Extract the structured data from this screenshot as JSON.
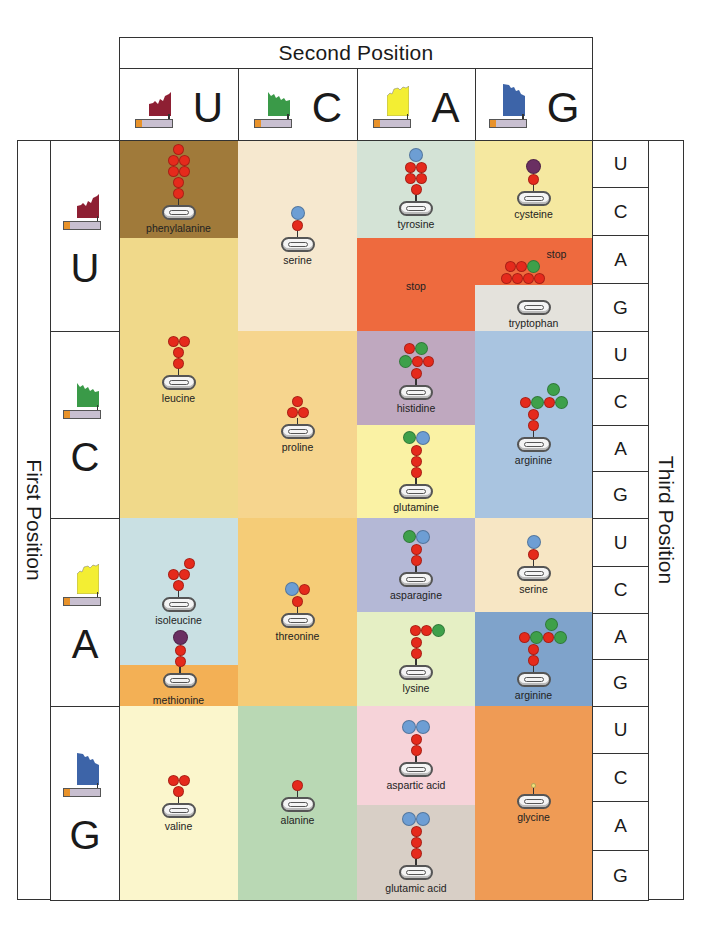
{
  "title_second": "Second Position",
  "title_first": "First Position",
  "title_third": "Third Position",
  "bases": [
    "U",
    "C",
    "A",
    "G"
  ],
  "base_colors": {
    "U": "#8e1f33",
    "C": "#3a9a48",
    "A": "#f3ee33",
    "G": "#3d64a8"
  },
  "second_position": [
    {
      "base": "U"
    },
    {
      "base": "C"
    },
    {
      "base": "A"
    },
    {
      "base": "G"
    }
  ],
  "first_position": [
    {
      "base": "U"
    },
    {
      "base": "C"
    },
    {
      "base": "A"
    },
    {
      "base": "G"
    }
  ],
  "third_position": [
    "U",
    "C",
    "A",
    "G",
    "U",
    "C",
    "A",
    "G",
    "U",
    "C",
    "A",
    "G",
    "U",
    "C",
    "A",
    "G"
  ],
  "cells": {
    "UU_top": {
      "label": "phenylalanine",
      "color": "#a07a3a"
    },
    "UU_bot": {
      "label": "leucine",
      "color": "#f0d98a"
    },
    "UC": {
      "label": "serine",
      "color": "#f6e8cf"
    },
    "UA_top": {
      "label": "tyrosine",
      "color": "#d4e3d6"
    },
    "UA_bot": {
      "label": "stop",
      "color": "#ee6a3e"
    },
    "UG_cys": {
      "label": "cysteine",
      "color": "#f5e8a0"
    },
    "UG_stop": {
      "label": "stop",
      "color": "#ee6a3e"
    },
    "UG_trp": {
      "label": "tryptophan",
      "color": "#e4e2dc"
    },
    "CC": {
      "label": "proline",
      "color": "#f6d58e"
    },
    "CA_top": {
      "label": "histidine",
      "color": "#bfa8bf"
    },
    "CA_bot": {
      "label": "glutamine",
      "color": "#faf2a4"
    },
    "CG": {
      "label": "arginine",
      "color": "#a9c4e0"
    },
    "AU_top": {
      "label": "isoleucine",
      "color": "#c9e0e3"
    },
    "AU_bot": {
      "label": "methionine",
      "color": "#f3b055"
    },
    "AC": {
      "label": "threonine",
      "color": "#f5cc77"
    },
    "AA_top": {
      "label": "asparagine",
      "color": "#b4b8d6"
    },
    "AA_bot": {
      "label": "lysine",
      "color": "#e5efc4"
    },
    "AG_top": {
      "label": "serine",
      "color": "#f7e6c4"
    },
    "AG_bot": {
      "label": "arginine",
      "color": "#7fa3cb"
    },
    "GU": {
      "label": "valine",
      "color": "#fbf6cc"
    },
    "GC": {
      "label": "alanine",
      "color": "#b9d8b4"
    },
    "GA_top": {
      "label": "aspartic acid",
      "color": "#f6d3d9"
    },
    "GA_bot": {
      "label": "glutamic acid",
      "color": "#d8cfc6"
    },
    "GG": {
      "label": "glycine",
      "color": "#ef9b55"
    }
  },
  "icons": {
    "nucleotide": "nucleotide-flag-icon",
    "trna": "trna-anchor-icon",
    "molecule": "amino-acid-side-chain-icon"
  }
}
